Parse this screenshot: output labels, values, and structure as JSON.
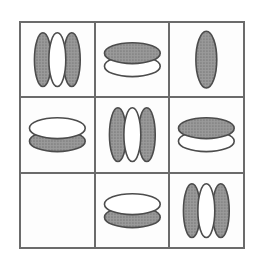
{
  "figure": {
    "colors": {
      "background": "#ffffff",
      "cell_background": "#fdfdfd",
      "grid_line": "#6b6b6b",
      "ellipse_outline": "#4c4c4c",
      "shaded_fill": "#9b9b9b",
      "shaded_dot": "#6f6f6f",
      "unfilled_fill": "#ffffff"
    },
    "grid": {
      "rows": 3,
      "cols": 3,
      "cells": [
        {
          "row": 0,
          "col": 0,
          "shape": "vertical-ellipse-triplet",
          "pattern": [
            "shaded",
            "unfilled",
            "shaded"
          ]
        },
        {
          "row": 0,
          "col": 1,
          "shape": "horizontal-ellipse-pair",
          "pattern": [
            "shaded",
            "unfilled"
          ]
        },
        {
          "row": 0,
          "col": 2,
          "shape": "vertical-ellipse-single",
          "pattern": [
            "shaded"
          ]
        },
        {
          "row": 1,
          "col": 0,
          "shape": "horizontal-ellipse-pair",
          "pattern": [
            "unfilled",
            "shaded"
          ]
        },
        {
          "row": 1,
          "col": 1,
          "shape": "vertical-ellipse-triplet",
          "pattern": [
            "shaded",
            "unfilled",
            "shaded"
          ]
        },
        {
          "row": 1,
          "col": 2,
          "shape": "horizontal-ellipse-pair",
          "pattern": [
            "shaded",
            "unfilled"
          ]
        },
        {
          "row": 2,
          "col": 0,
          "shape": "empty",
          "pattern": []
        },
        {
          "row": 2,
          "col": 1,
          "shape": "horizontal-ellipse-pair",
          "pattern": [
            "unfilled",
            "shaded"
          ]
        },
        {
          "row": 2,
          "col": 2,
          "shape": "vertical-ellipse-triplet",
          "pattern": [
            "shaded",
            "unfilled",
            "shaded"
          ]
        }
      ]
    }
  }
}
